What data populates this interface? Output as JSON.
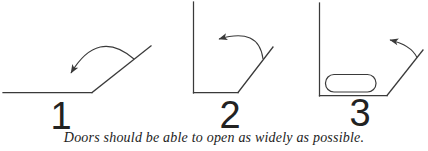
{
  "canvas": {
    "width": 428,
    "height": 151
  },
  "colors": {
    "line": "#3a3a3a",
    "label": "#222222",
    "caption": "#1c1c1c",
    "background": "#ffffff"
  },
  "diagrams": [
    {
      "name": "door-opens-wide-onto-wall",
      "label": "1"
    },
    {
      "name": "door-opens-past-ninety-degrees",
      "label": "2"
    },
    {
      "name": "door-opening-limited-by-obstruction",
      "label": "3"
    }
  ],
  "caption": {
    "text": "Doors should be able to open as widely as possible."
  }
}
